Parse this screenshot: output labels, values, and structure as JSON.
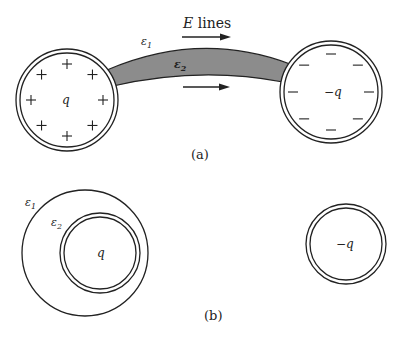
{
  "colors": {
    "stroke": "#222222",
    "tube_fill": "#8c8c8c",
    "background": "#ffffff"
  },
  "figure_a": {
    "caption": "(a)",
    "e_lines_label_E": "E",
    "e_lines_label_rest": " lines",
    "eps1_label": "ε",
    "eps1_sub": "1",
    "eps2_label": "ε",
    "eps2_sub": "2",
    "left_sphere": {
      "charge_label": "q",
      "surface_symbol": "+",
      "symbol_count": 8
    },
    "right_sphere": {
      "charge_label": "−q",
      "surface_symbol": "−",
      "symbol_count": 8
    }
  },
  "figure_b": {
    "caption": "(b)",
    "eps1_label": "ε",
    "eps1_sub": "1",
    "eps2_label": "ε",
    "eps2_sub": "2",
    "left_sphere": {
      "charge_label": "q"
    },
    "right_sphere": {
      "charge_label": "−q"
    }
  }
}
